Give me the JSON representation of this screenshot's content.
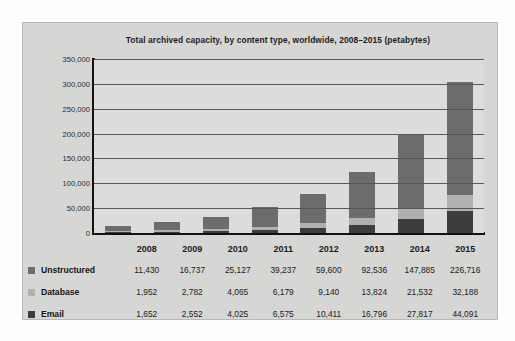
{
  "chart_data": {
    "type": "bar",
    "stacked": true,
    "title": "Total archived capacity, by content type, worldwide, 2008–2015 (petabytes)",
    "xlabel": "",
    "ylabel": "",
    "ylim": [
      0,
      350000
    ],
    "yticks": [
      "350,000",
      "300,000",
      "250,000",
      "200,000",
      "150,000",
      "100,000",
      "50,000",
      "0"
    ],
    "ytick_values": [
      350000,
      300000,
      250000,
      200000,
      150000,
      100000,
      50000,
      0
    ],
    "grid": true,
    "legend_position": "table-left",
    "categories": [
      "2008",
      "2009",
      "2010",
      "2011",
      "2012",
      "2013",
      "2014",
      "2015"
    ],
    "series": [
      {
        "name": "Unstructured",
        "color": "#6c6c6e",
        "values": [
          11430,
          16737,
          25127,
          39237,
          59600,
          92536,
          147885,
          226716
        ],
        "labels": [
          "11,430",
          "16,737",
          "25,127",
          "39,237",
          "59,600",
          "92,536",
          "147,885",
          "226,716"
        ]
      },
      {
        "name": "Database",
        "color": "#b0b0ae",
        "values": [
          1952,
          2782,
          4065,
          6179,
          9140,
          13824,
          21532,
          32188
        ],
        "labels": [
          "1,952",
          "2,782",
          "4,065",
          "6,179",
          "9,140",
          "13,824",
          "21,532",
          "32,188"
        ]
      },
      {
        "name": "Email",
        "color": "#3d3d3f",
        "values": [
          1652,
          2552,
          4025,
          6575,
          10411,
          16796,
          27817,
          44091
        ],
        "labels": [
          "1,652",
          "2,552",
          "4,025",
          "6,575",
          "10,411",
          "16,796",
          "27,817",
          "44,091"
        ]
      }
    ]
  },
  "colors": {
    "panel_background": "#d6d6d4",
    "plot_background": "#dcdcda",
    "axis": "#121212",
    "gridline": "#58585a",
    "text": "#1c1c1c"
  }
}
